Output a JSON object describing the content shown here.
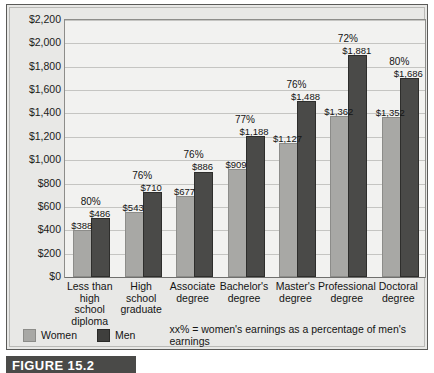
{
  "chart_data": {
    "type": "bar",
    "title": "",
    "xlabel": "",
    "ylabel": "",
    "ylim": [
      0,
      2200
    ],
    "ytick_step": 200,
    "grid": true,
    "legend_position": "bottom-left",
    "categories": [
      "Less than high school diploma",
      "High school graduate",
      "Associate degree",
      "Bachelor's degree",
      "Master's degree",
      "Professional degree",
      "Doctoral degree"
    ],
    "ytick_labels": [
      "$2,200",
      "$2,000",
      "$1,800",
      "$1,600",
      "$1,400",
      "$1,200",
      "$1,000",
      "$800",
      "$600",
      "$400",
      "$200",
      "$0"
    ],
    "ytick_values": [
      2200,
      2000,
      1800,
      1600,
      1400,
      1200,
      1000,
      800,
      600,
      400,
      200,
      0
    ],
    "series": [
      {
        "name": "Women",
        "color": "#a8a8a5",
        "values": [
          388,
          543,
          677,
          909,
          1127,
          1362,
          1352
        ],
        "labels": [
          "$388",
          "$543",
          "$677",
          "$909",
          "$1,127",
          "$1,362",
          "$1,352"
        ]
      },
      {
        "name": "Men",
        "color": "#4a4a48",
        "values": [
          486,
          710,
          886,
          1188,
          1488,
          1881,
          1686
        ],
        "labels": [
          "$486",
          "$710",
          "$886",
          "$1,188",
          "$1,488",
          "$1,881",
          "$1,686"
        ]
      }
    ],
    "annotations": {
      "percent_labels": [
        "80%",
        "76%",
        "76%",
        "77%",
        "76%",
        "72%",
        "80%"
      ],
      "percent_note": "xx% = women's earnings as a percentage of men's earnings"
    }
  },
  "categories_wrapped": [
    [
      "Less than",
      "high",
      "school",
      "diploma"
    ],
    [
      "High",
      "school",
      "graduate"
    ],
    [
      "Associate",
      "degree"
    ],
    [
      "Bachelor's",
      "degree"
    ],
    [
      "Master's",
      "degree"
    ],
    [
      "Professional",
      "degree"
    ],
    [
      "Doctoral",
      "degree"
    ]
  ],
  "legend": {
    "women_label": "Women",
    "men_label": "Men",
    "note": "xx% = women's earnings as a percentage of men's earnings"
  },
  "caption": {
    "label": "FIGURE 15.2"
  },
  "colors": {
    "women": "#a8a8a5",
    "men": "#4a4a48",
    "plot_background": "#f2f2f0",
    "figure_background": "#e8e8e6",
    "gridline": "#c5c5c2",
    "caption_bar": "#4a4a48"
  }
}
